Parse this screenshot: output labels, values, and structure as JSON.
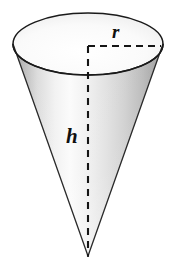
{
  "figure": {
    "kind": "geometry-diagram",
    "shape_name": "cone",
    "background_color": "#ffffff",
    "outline_color": "#1a1a1a",
    "dash_color": "#151515",
    "labels": {
      "radius": "r",
      "height": "h"
    },
    "geometry": {
      "top_ellipse": {
        "center_x": 88,
        "center_y": 44,
        "radius_x": 75,
        "radius_y": 31
      },
      "apex": {
        "x": 88,
        "y": 256
      },
      "radius_line": {
        "from_x": 88,
        "from_y": 46,
        "to_x": 161,
        "to_y": 46
      },
      "height_line": {
        "from_x": 88,
        "from_y": 46,
        "to_x": 88,
        "to_y": 256
      }
    },
    "shading": {
      "body_light": "#fbfbfb",
      "body_mid": "#d7d7d7",
      "body_dark": "#9d9d9d",
      "disc_fill": "#f7f7f7",
      "disc_edge": "#dedede"
    }
  }
}
